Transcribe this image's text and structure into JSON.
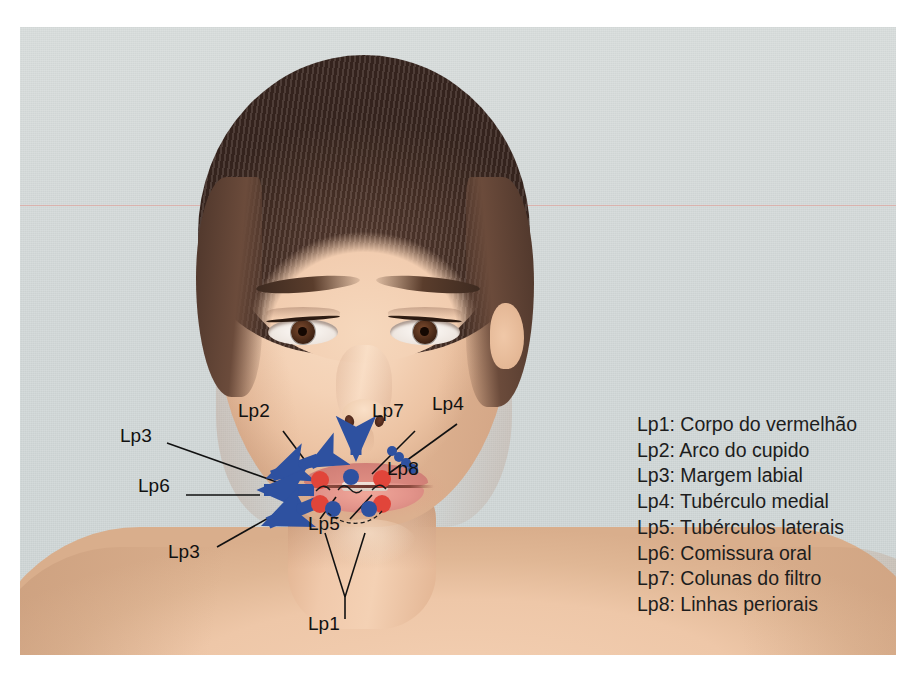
{
  "figure": {
    "kind": "annotated-photograph",
    "background_color": "#d6dcdc",
    "plate_border_color": "#ffffff"
  },
  "annotation_colors": {
    "arrow_blue": "#2e51a0",
    "dot_blue": "#2e51a0",
    "dot_red": "#e1453a",
    "leader_line": "#111111",
    "label_text": "#111111",
    "scanline_pink": "#e2968c"
  },
  "face_labels": [
    {
      "id": "Lp2",
      "text": "Lp2",
      "x": 218,
      "y": 383
    },
    {
      "id": "Lp7",
      "text": "Lp7",
      "x": 352,
      "y": 383
    },
    {
      "id": "Lp4",
      "text": "Lp4",
      "x": 412,
      "y": 376
    },
    {
      "id": "Lp3-upper",
      "text": "Lp3",
      "x": 100,
      "y": 408
    },
    {
      "id": "Lp8",
      "text": "Lp8",
      "x": 367,
      "y": 441
    },
    {
      "id": "Lp6",
      "text": "Lp6",
      "x": 118,
      "y": 458
    },
    {
      "id": "Lp5",
      "text": "Lp5",
      "x": 288,
      "y": 496
    },
    {
      "id": "Lp3-lower",
      "text": "Lp3",
      "x": 148,
      "y": 524
    },
    {
      "id": "Lp1",
      "text": "Lp1",
      "x": 288,
      "y": 596
    }
  ],
  "legend": {
    "items": [
      {
        "key": "Lp1",
        "label": "Lp1: Corpo do vermelhão"
      },
      {
        "key": "Lp2",
        "label": "Lp2: Arco do cupido"
      },
      {
        "key": "Lp3",
        "label": "Lp3: Margem labial"
      },
      {
        "key": "Lp4",
        "label": "Lp4: Tubérculo medial"
      },
      {
        "key": "Lp5",
        "label": "Lp5: Tubérculos laterais"
      },
      {
        "key": "Lp6",
        "label": "Lp6: Comissura oral"
      },
      {
        "key": "Lp7",
        "label": "Lp7: Colunas do filtro"
      },
      {
        "key": "Lp8",
        "label": "Lp8: Linhas periorais"
      }
    ]
  },
  "markers": {
    "red_dots": [
      {
        "x": 300,
        "y": 453,
        "r": 9
      },
      {
        "x": 362,
        "y": 452,
        "r": 9
      },
      {
        "x": 300,
        "y": 477,
        "r": 9
      },
      {
        "x": 362,
        "y": 477,
        "r": 9
      }
    ],
    "blue_dots": [
      {
        "x": 331,
        "y": 450,
        "r": 8
      },
      {
        "x": 313,
        "y": 482,
        "r": 8
      },
      {
        "x": 349,
        "y": 482,
        "r": 8
      }
    ],
    "perioral_dot_chain": [
      {
        "x": 372,
        "y": 424,
        "r": 5
      },
      {
        "x": 379,
        "y": 430,
        "r": 5
      },
      {
        "x": 386,
        "y": 436,
        "r": 5
      },
      {
        "x": 393,
        "y": 442,
        "r": 5
      }
    ]
  }
}
